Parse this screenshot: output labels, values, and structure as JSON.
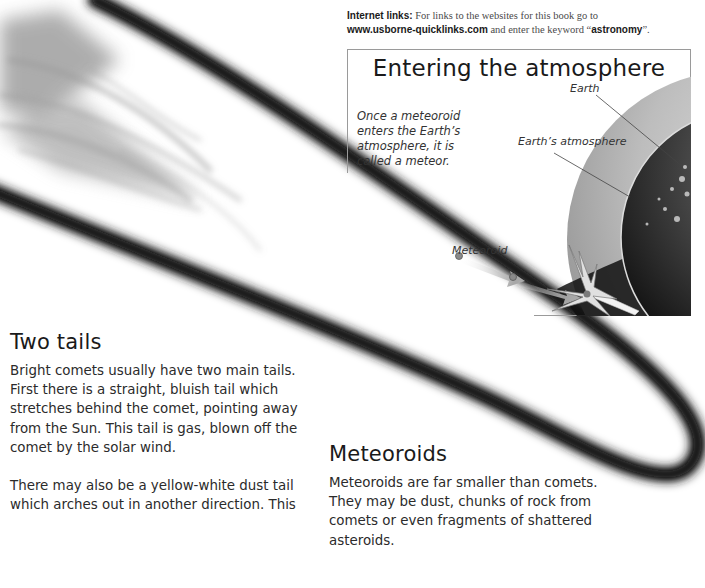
{
  "internet_links": {
    "label": "Internet links:",
    "text_before": "For links to the websites for this book go to",
    "url": "www.usborne-quicklinks.com",
    "text_middle": "and enter the keyword “",
    "keyword": "astronomy",
    "text_after": "”."
  },
  "inset": {
    "title": "Entering the atmosphere",
    "caption": "Once a meteoroid enters the Earth’s atmosphere, it is called a meteor.",
    "labels": {
      "earth": "Earth",
      "atmosphere": "Earth’s atmosphere",
      "meteoroid": "Meteoroid"
    }
  },
  "sections": {
    "two_tails": {
      "heading": "Two tails",
      "paragraphs": [
        "Bright comets usually have two main tails. First there is a straight, bluish tail which stretches behind the comet, pointing away from the Sun. This tail is gas, blown off the comet by the solar wind.",
        "There may also be a yellow-white dust tail which arches out in another direction. This"
      ]
    },
    "meteoroids": {
      "heading": "Meteoroids",
      "paragraphs": [
        "Meteoroids are far smaller than comets. They may be dust, chunks of rock from comets or even fragments of shattered asteroids."
      ]
    }
  },
  "colors": {
    "text": "#2b2b2b",
    "comet_dark": "#111111",
    "atmosphere": "#bdbdbd",
    "border": "#9a9a9a"
  }
}
